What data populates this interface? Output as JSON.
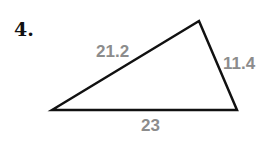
{
  "problem": {
    "number": "4."
  },
  "triangle": {
    "vertices": {
      "left": [
        52,
        110
      ],
      "top": [
        199,
        21
      ],
      "right": [
        237,
        110
      ]
    },
    "sides": {
      "left_top": "21.2",
      "top_right": "11.4",
      "bottom": "23"
    },
    "stroke_color": "#111111",
    "label_color": "#8c8c8c"
  }
}
